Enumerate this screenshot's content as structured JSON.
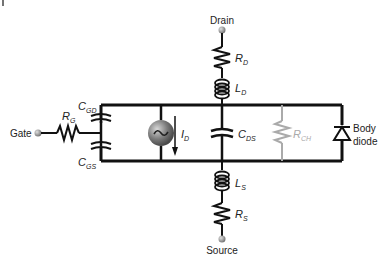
{
  "diagram": {
    "terminals": {
      "drain": "Drain",
      "gate": "Gate",
      "source": "Source"
    },
    "components": {
      "rd": {
        "main": "R",
        "sub": "D"
      },
      "ld": {
        "main": "L",
        "sub": "D"
      },
      "rg": {
        "main": "R",
        "sub": "G"
      },
      "cgd": {
        "main": "C",
        "sub": "GD"
      },
      "cgs": {
        "main": "C",
        "sub": "GS"
      },
      "id": {
        "main": "I",
        "sub": "D"
      },
      "cds": {
        "main": "C",
        "sub": "DS"
      },
      "rch": {
        "main": "R",
        "sub": "CH"
      },
      "ls": {
        "main": "L",
        "sub": "S"
      },
      "rs": {
        "main": "R",
        "sub": "S"
      }
    },
    "body_diode": {
      "line1": "Body",
      "line2": "diode"
    },
    "colors": {
      "wire": "#111111",
      "terminal": "#8a8a8a",
      "rch": "#aaaaaa",
      "source_sphere": "#7a7a7a"
    }
  }
}
